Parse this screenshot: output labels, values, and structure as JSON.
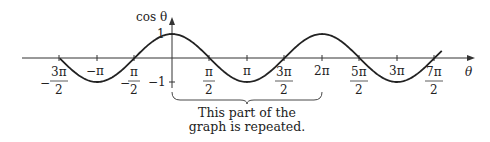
{
  "chart_data": {
    "type": "line",
    "title": "",
    "function": "cos θ",
    "xlabel": "θ",
    "ylabel": "cos θ",
    "xlim": [
      -4.7,
      11.3
    ],
    "ylim": [
      -1,
      1
    ],
    "y_ticks": [
      {
        "value": 1,
        "label": "1"
      },
      {
        "value": -1,
        "label": "−1"
      }
    ],
    "x_ticks": [
      {
        "value": -4.712,
        "label": "−3π/2"
      },
      {
        "value": -3.1416,
        "label": "−π"
      },
      {
        "value": -1.5708,
        "label": "−π/2"
      },
      {
        "value": 1.5708,
        "label": "π/2"
      },
      {
        "value": 3.1416,
        "label": "π"
      },
      {
        "value": 4.712,
        "label": "3π/2"
      },
      {
        "value": 6.2832,
        "label": "2π"
      },
      {
        "value": 7.854,
        "label": "5π/2"
      },
      {
        "value": 9.4248,
        "label": "3π"
      },
      {
        "value": 10.9956,
        "label": "7π/2"
      }
    ],
    "annotation": {
      "type": "brace",
      "from": 0,
      "to": 6.2832,
      "text": "This part of the graph is repeated."
    },
    "grid": false
  },
  "labels": {
    "y_axis": "cos θ",
    "x_axis": "θ",
    "y_one": "1",
    "y_neg_one": "−1",
    "neg_3pi_2_num": "3π",
    "neg_pi": "−π",
    "neg_pi_2_num": "π",
    "pi_2_num": "π",
    "pi": "π",
    "three_pi_2_num": "3π",
    "two_pi": "2π",
    "five_pi_2_num": "5π",
    "three_pi": "3π",
    "seven_pi_2_num": "7π",
    "den": "2",
    "minus": "−",
    "caption_line1": "This part of the",
    "caption_line2": "graph is repeated."
  }
}
